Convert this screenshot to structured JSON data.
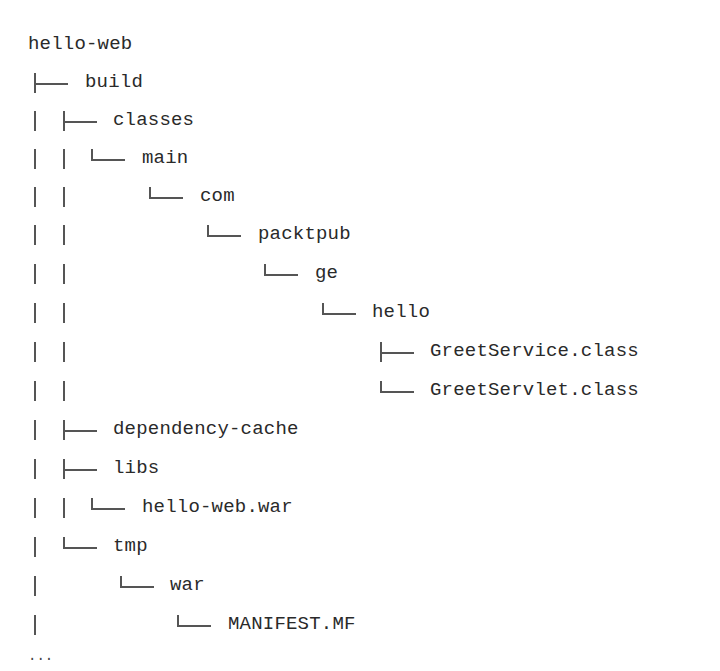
{
  "tree": {
    "root": "hello-web",
    "nodes": [
      {
        "name": "build",
        "depth": 1,
        "connector": "tee"
      },
      {
        "name": "classes",
        "depth": 2,
        "connector": "tee"
      },
      {
        "name": "main",
        "depth": 3,
        "connector": "elbow"
      },
      {
        "name": "com",
        "depth": 4,
        "connector": "elbow"
      },
      {
        "name": "packtpub",
        "depth": 5,
        "connector": "elbow"
      },
      {
        "name": "ge",
        "depth": 6,
        "connector": "elbow"
      },
      {
        "name": "hello",
        "depth": 7,
        "connector": "elbow"
      },
      {
        "name": "GreetService.class",
        "depth": 8,
        "connector": "tee"
      },
      {
        "name": "GreetServlet.class",
        "depth": 8,
        "connector": "elbow"
      },
      {
        "name": "dependency-cache",
        "depth": 2,
        "connector": "tee"
      },
      {
        "name": "libs",
        "depth": 2,
        "connector": "tee"
      },
      {
        "name": "hello-web.war",
        "depth": 3,
        "connector": "elbow"
      },
      {
        "name": "tmp",
        "depth": 2,
        "connector": "elbow"
      },
      {
        "name": "war",
        "depth": 3,
        "connector": "elbow"
      },
      {
        "name": "MANIFEST.MF",
        "depth": 4,
        "connector": "elbow"
      }
    ],
    "ellipsis": "..."
  }
}
